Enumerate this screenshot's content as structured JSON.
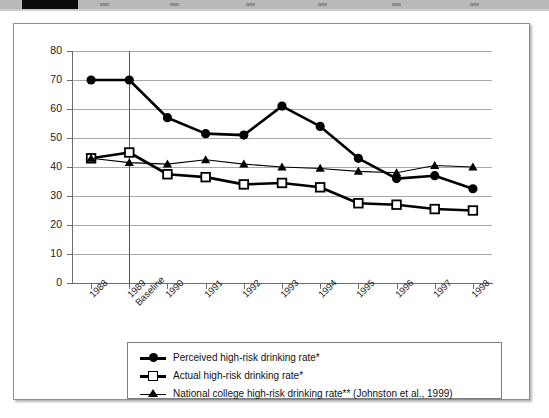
{
  "header_strip": {
    "name": "page-header-strip",
    "black_band_color": "#0b0b0b",
    "band_color": "#b9b9b9"
  },
  "chart_data": {
    "type": "line",
    "title": "",
    "subtitle": "",
    "xlabel": "",
    "ylabel": "",
    "ylim": [
      0,
      80
    ],
    "ytick_step": 10,
    "grid": true,
    "legend_position": "bottom",
    "categories": [
      "1988",
      "1989 Baseline",
      "1990",
      "1991",
      "1992",
      "1993",
      "1994",
      "1995",
      "1996",
      "1997",
      "1998"
    ],
    "xtick_labels": [
      [
        "1988",
        ""
      ],
      [
        "1989",
        "Baseline"
      ],
      [
        "1990",
        ""
      ],
      [
        "1991",
        ""
      ],
      [
        "1992",
        ""
      ],
      [
        "1993",
        ""
      ],
      [
        "1994",
        ""
      ],
      [
        "1995",
        ""
      ],
      [
        "1996",
        ""
      ],
      [
        "1997",
        ""
      ],
      [
        "1998",
        ""
      ]
    ],
    "ytick_labels": [
      "0",
      "10",
      "20",
      "30",
      "40",
      "50",
      "60",
      "70",
      "80"
    ],
    "baseline_marker_category": "1989 Baseline",
    "series": [
      {
        "name": "Perceived high-risk drinking rate*",
        "marker": "filled-circle",
        "color": "#000000",
        "line_width": 2.6,
        "values": [
          70,
          70,
          57,
          51.5,
          51,
          61,
          54,
          43,
          36,
          37,
          32.5
        ]
      },
      {
        "name": "Actual high-risk drinking rate*",
        "marker": "open-square",
        "color": "#000000",
        "line_width": 2.6,
        "values": [
          43,
          45,
          37.5,
          36.5,
          34,
          34.5,
          33,
          27.5,
          27,
          25.5,
          25
        ]
      },
      {
        "name": "National college high-risk drinking rate** (Johnston et al., 1999)",
        "marker": "filled-triangle",
        "color": "#000000",
        "line_width": 1.1,
        "values": [
          43,
          41.5,
          41,
          42.5,
          41,
          40,
          39.5,
          38.5,
          38,
          40.5,
          40
        ]
      }
    ]
  },
  "legend": {
    "entries": [
      {
        "label": "Perceived high-risk drinking rate*",
        "marker": "filled-circle"
      },
      {
        "label": "Actual high-risk drinking rate*",
        "marker": "open-square"
      },
      {
        "label": "National college high-risk drinking rate** (Johnston et al., 1999)",
        "marker": "filled-triangle"
      }
    ]
  }
}
